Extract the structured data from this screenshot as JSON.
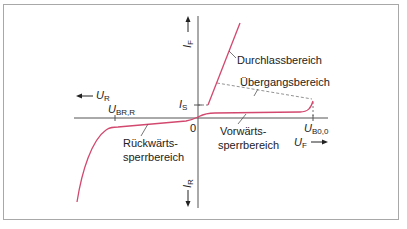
{
  "diagram": {
    "type": "thyristor-characteristic-curve",
    "colors": {
      "curve": "#d2486e",
      "axis": "#555555",
      "frame": "#a8a8a8",
      "text": "#222222"
    },
    "axes": {
      "y_positive": {
        "symbol": "I",
        "sub": "F"
      },
      "y_negative": {
        "symbol": "I",
        "sub": "R"
      },
      "x_positive": {
        "symbol": "U",
        "sub": "F"
      },
      "x_negative": {
        "symbol": "U",
        "sub": "R"
      },
      "origin": "0"
    },
    "markers": {
      "holding_current": {
        "symbol": "I",
        "sub": "S"
      },
      "reverse_breakdown": {
        "symbol": "U",
        "sub": "BR,R"
      },
      "breakover": {
        "symbol": "U",
        "sub": "B0,0"
      }
    },
    "regions": {
      "on_state": "Durchlassbereich",
      "transition": "Übergangsbereich",
      "forward_blocking_1": "Vorwärts-",
      "forward_blocking_2": "sperrbereich",
      "reverse_blocking_1": "Rückwärts-",
      "reverse_blocking_2": "sperrbereich"
    }
  }
}
